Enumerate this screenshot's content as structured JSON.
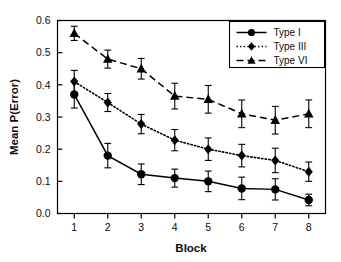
{
  "chart_data": {
    "type": "line",
    "title": "",
    "xlabel": "Block",
    "ylabel": "Mean P(Error)",
    "categories": [
      "1",
      "2",
      "3",
      "4",
      "5",
      "6",
      "7",
      "8"
    ],
    "x": [
      1,
      2,
      3,
      4,
      5,
      6,
      7,
      8
    ],
    "xlim": [
      0.5,
      8.5
    ],
    "ylim": [
      0.0,
      0.6
    ],
    "yticks": [
      "0.0",
      "0.1",
      "0.2",
      "0.3",
      "0.4",
      "0.5",
      "0.6"
    ],
    "ytick_values": [
      0.0,
      0.1,
      0.2,
      0.3,
      0.4,
      0.5,
      0.6
    ],
    "xticks": [
      "1",
      "2",
      "3",
      "4",
      "5",
      "6",
      "7",
      "8"
    ],
    "grid": false,
    "legend_position": "top-right",
    "series": [
      {
        "name": "Type I",
        "marker": "circle",
        "line_style": "solid",
        "color": "#000000",
        "values": [
          0.37,
          0.18,
          0.122,
          0.11,
          0.1,
          0.078,
          0.075,
          0.042
        ],
        "errors": [
          0.042,
          0.038,
          0.032,
          0.028,
          0.032,
          0.035,
          0.033,
          0.018
        ]
      },
      {
        "name": "Type III",
        "marker": "diamond",
        "line_style": "dotted",
        "color": "#000000",
        "values": [
          0.41,
          0.345,
          0.278,
          0.228,
          0.2,
          0.18,
          0.165,
          0.13
        ],
        "errors": [
          0.035,
          0.028,
          0.03,
          0.033,
          0.035,
          0.035,
          0.038,
          0.03
        ]
      },
      {
        "name": "Type VI",
        "marker": "triangle",
        "line_style": "dashed",
        "color": "#000000",
        "values": [
          0.56,
          0.48,
          0.45,
          0.365,
          0.355,
          0.31,
          0.29,
          0.31
        ],
        "errors": [
          0.022,
          0.028,
          0.032,
          0.04,
          0.043,
          0.043,
          0.043,
          0.043
        ]
      }
    ]
  },
  "legend": {
    "items": [
      {
        "label": "Type I"
      },
      {
        "label": "Type III"
      },
      {
        "label": "Type VI"
      }
    ]
  }
}
